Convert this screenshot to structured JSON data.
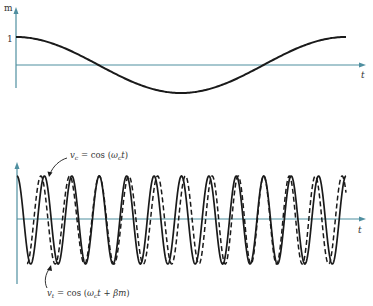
{
  "figure": {
    "top_panel": {
      "y_axis_label": "m",
      "x_axis_label": "t",
      "tick_label_one": "1",
      "signal": "message m(t) — slow cosine, one full period"
    },
    "bottom_panel": {
      "x_axis_label": "t",
      "carrier_label": {
        "lhs_var": "v",
        "lhs_sub": "c",
        "eq": " = ",
        "fn": "cos",
        "open": " (",
        "omega": "ω",
        "omega_sub": "c",
        "t": "t",
        "close": ")"
      },
      "modulated_label": {
        "lhs_var": "v",
        "lhs_sub": "t",
        "eq": " = ",
        "fn": "cos",
        "open": " (",
        "omega": "ω",
        "omega_sub": "c",
        "t": "t",
        "plus": " + ",
        "beta": "β",
        "m": "m",
        "close": ")"
      }
    },
    "colors": {
      "axis": "#4f8fa0",
      "curve": "#1a1a1a",
      "text": "#333333"
    }
  },
  "chart_data": [
    {
      "type": "line",
      "title": "",
      "xlabel": "t",
      "ylabel": "m",
      "series": [
        {
          "name": "m(t)",
          "function": "cos(2πt/T)",
          "amplitude": 1,
          "periods_shown": 1
        }
      ],
      "y_ticks": [
        "1"
      ],
      "grid": false
    },
    {
      "type": "line",
      "title": "",
      "xlabel": "t",
      "ylabel": "",
      "series": [
        {
          "name": "v_c = cos(ω_c t)",
          "style": "solid",
          "cycles_shown": 12
        },
        {
          "name": "v_t = cos(ω_c t + βm)",
          "style": "dashed",
          "cycles_shown": 12
        }
      ],
      "grid": false
    }
  ]
}
